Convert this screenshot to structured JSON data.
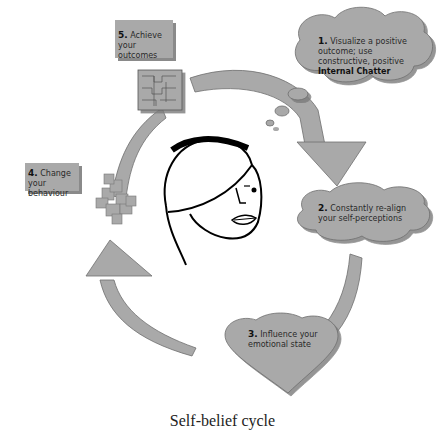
{
  "diagram": {
    "title": "Self-belief cycle",
    "colors": {
      "fill": "#a9a9a9",
      "shadow": "#8a8a8a",
      "stroke": "#6e6e6e",
      "text": "#2a2a2a",
      "face": "#000000"
    },
    "steps": [
      {
        "number": "1.",
        "text": "Visualize a positive outcome; use constructive, positive ",
        "bold_text": "Internal Chatter",
        "shape": "cloud"
      },
      {
        "number": "2.",
        "text": "Constantly re-align your self-perceptions",
        "shape": "cloud"
      },
      {
        "number": "3.",
        "text": "Influence your emotional state",
        "shape": "heart"
      },
      {
        "number": "4.",
        "text": "Change your behaviour",
        "shape": "box"
      },
      {
        "number": "5.",
        "text": "Achieve your outcomes",
        "shape": "box"
      }
    ],
    "center_image": "woman-face-line-drawing",
    "icons": [
      "puzzle-square-icon",
      "scattered-puzzle-icon",
      "thought-bubble-icon"
    ]
  }
}
